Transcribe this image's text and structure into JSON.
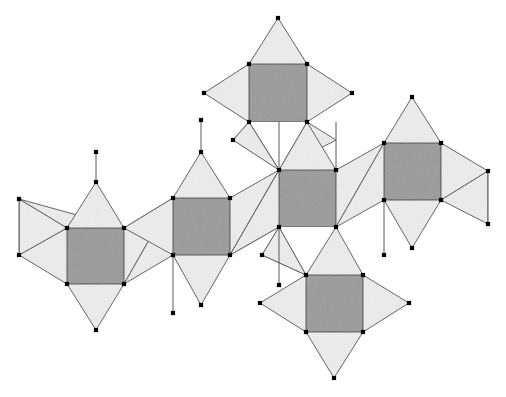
{
  "figure": {
    "canvas": {
      "width": 506,
      "height": 397
    },
    "colors": {
      "background": "#ffffff",
      "square_fill": "#9a9a9a",
      "triangle_fill": "#ededed",
      "square_stroke": "#444444",
      "triangle_stroke": "#5a5a5a",
      "edge_stroke": "#5a5a5a",
      "vertex_fill": "#000000"
    },
    "style": {
      "vertex_dot_size": 4.2,
      "square_stroke_width": 1.1,
      "triangle_stroke_width": 1.0,
      "edge_stroke_width": 1.0
    },
    "counts": {
      "squares": 6,
      "triangles": 22,
      "vertices": 46
    },
    "squares": [
      {
        "name": "square-top",
        "points": "249,64 307,64 307,122 249,122"
      },
      {
        "name": "square-left",
        "points": "67,228 124,228 124,284 67,284"
      },
      {
        "name": "square-mid-left",
        "points": "173,198 230,198 230,255 173,255"
      },
      {
        "name": "square-center",
        "points": "279,170 336,170 336,227 279,227"
      },
      {
        "name": "square-right",
        "points": "384,143 441,143 441,200 384,200"
      },
      {
        "name": "square-bottom",
        "points": "306,275 363,275 363,332 306,332"
      }
    ],
    "triangles": [
      {
        "name": "tri-top-up",
        "points": "249,64 307,64 278,18"
      },
      {
        "name": "tri-top-left",
        "points": "249,64 249,122 204,93"
      },
      {
        "name": "tri-top-right",
        "points": "307,64 307,122 352,93"
      },
      {
        "name": "tri-top-down-left",
        "points": "249,122 278,168 233,140"
      },
      {
        "name": "tri-top-down-right",
        "points": "307,122 279,170 336,140"
      },
      {
        "name": "tri-left-fan-upper",
        "points": "19,199 67,228 124,228"
      },
      {
        "name": "tri-left-fan-lower",
        "points": "19,255 67,228 67,284"
      },
      {
        "name": "tri-left-edge-up",
        "points": "19,199 19,255 67,228"
      },
      {
        "name": "tri-left-apex",
        "points": "67,228 124,228 96,182"
      },
      {
        "name": "tri-left-down",
        "points": "67,284 124,284 96,330"
      },
      {
        "name": "tri-left-right-up",
        "points": "124,228 173,198 124,284"
      },
      {
        "name": "tri-left-right-low",
        "points": "124,284 173,255 173,198"
      },
      {
        "name": "tri-ml-apex",
        "points": "173,198 230,198 201,152"
      },
      {
        "name": "tri-ml-left-up",
        "points": "124,228 173,198 173,255"
      },
      {
        "name": "tri-ml-down",
        "points": "173,255 230,255 201,305"
      },
      {
        "name": "tri-ml-right-up",
        "points": "230,198 279,170 230,255"
      },
      {
        "name": "tri-ml-right-low",
        "points": "230,255 279,227 279,170"
      },
      {
        "name": "tri-c-apex-left",
        "points": "279,170 233,140 249,122"
      },
      {
        "name": "tri-c-apex-right",
        "points": "279,170 336,170 307,122"
      },
      {
        "name": "tri-c-left-low",
        "points": "230,255 279,227 279,170"
      },
      {
        "name": "tri-c-right-up",
        "points": "336,170 384,143 336,227"
      },
      {
        "name": "tri-c-right-low",
        "points": "336,227 384,200 384,143"
      },
      {
        "name": "tri-c-down-left",
        "points": "279,227 306,275 262,255"
      },
      {
        "name": "tri-c-down-right",
        "points": "336,227 306,275 363,275"
      },
      {
        "name": "tri-r-apex",
        "points": "384,143 441,143 412,97"
      },
      {
        "name": "tri-r-down",
        "points": "384,200 441,200 412,248"
      },
      {
        "name": "tri-r-fan-upper",
        "points": "441,143 488,171 441,200"
      },
      {
        "name": "tri-r-fan-lower",
        "points": "488,171 488,224 441,200"
      },
      {
        "name": "tri-b-left",
        "points": "306,275 306,332 260,303"
      },
      {
        "name": "tri-b-right",
        "points": "363,275 363,332 409,303"
      },
      {
        "name": "tri-b-down",
        "points": "306,332 363,332 334,378"
      },
      {
        "name": "tri-b-up-left",
        "points": "306,275 279,227 262,255"
      }
    ],
    "edges": [
      {
        "name": "edge-left-vertical",
        "x1": 19,
        "y1": 199,
        "x2": 19,
        "y2": 255
      },
      {
        "name": "edge-ml-apex-vertical",
        "x1": 201,
        "y1": 152,
        "x2": 201,
        "y2": 120
      },
      {
        "name": "edge-ml-down-vertical",
        "x1": 173,
        "y1": 255,
        "x2": 173,
        "y2": 313
      },
      {
        "name": "edge-center-up-vertical",
        "x1": 279,
        "y1": 170,
        "x2": 279,
        "y2": 122
      },
      {
        "name": "edge-center-dn-vertical",
        "x1": 279,
        "y1": 227,
        "x2": 279,
        "y2": 285
      },
      {
        "name": "edge-right-up-vertical",
        "x1": 336,
        "y1": 170,
        "x2": 336,
        "y2": 122
      },
      {
        "name": "edge-right-dn-vertical",
        "x1": 384,
        "y1": 200,
        "x2": 384,
        "y2": 255
      },
      {
        "name": "edge-far-right-vertical",
        "x1": 488,
        "y1": 171,
        "x2": 488,
        "y2": 224
      },
      {
        "name": "edge-left-apex-vertical",
        "x1": 96,
        "y1": 182,
        "x2": 96,
        "y2": 152
      },
      {
        "name": "edge-left-down-vertical",
        "x1": 124,
        "y1": 284,
        "x2": 124,
        "y2": 284
      }
    ],
    "vertices": [
      {
        "name": "v-top-apex",
        "x": 278,
        "y": 18
      },
      {
        "name": "v-top-sq-tl",
        "x": 249,
        "y": 64
      },
      {
        "name": "v-top-sq-tr",
        "x": 307,
        "y": 64
      },
      {
        "name": "v-top-left-pt",
        "x": 204,
        "y": 93
      },
      {
        "name": "v-top-right-pt",
        "x": 352,
        "y": 93
      },
      {
        "name": "v-top-sq-bl",
        "x": 249,
        "y": 122
      },
      {
        "name": "v-top-sq-br",
        "x": 307,
        "y": 122
      },
      {
        "name": "v-top-dl",
        "x": 233,
        "y": 140
      },
      {
        "name": "v-r-apex",
        "x": 412,
        "y": 97
      },
      {
        "name": "v-ml-apex",
        "x": 201,
        "y": 152
      },
      {
        "name": "v-ml-apex-top",
        "x": 201,
        "y": 120
      },
      {
        "name": "v-r-sq-tl",
        "x": 384,
        "y": 143
      },
      {
        "name": "v-r-sq-tr",
        "x": 441,
        "y": 143
      },
      {
        "name": "v-c-sq-tl",
        "x": 279,
        "y": 170
      },
      {
        "name": "v-c-sq-tr",
        "x": 336,
        "y": 170
      },
      {
        "name": "v-far-right-top",
        "x": 488,
        "y": 171
      },
      {
        "name": "v-left-apex",
        "x": 96,
        "y": 182
      },
      {
        "name": "v-left-apex-top",
        "x": 96,
        "y": 152
      },
      {
        "name": "v-left-fan-top",
        "x": 19,
        "y": 199
      },
      {
        "name": "v-ml-sq-tl",
        "x": 173,
        "y": 198
      },
      {
        "name": "v-ml-sq-tr",
        "x": 230,
        "y": 198
      },
      {
        "name": "v-r-sq-bl",
        "x": 384,
        "y": 200
      },
      {
        "name": "v-r-sq-br",
        "x": 441,
        "y": 200
      },
      {
        "name": "v-far-right-bot",
        "x": 488,
        "y": 224
      },
      {
        "name": "v-c-sq-bl",
        "x": 279,
        "y": 227
      },
      {
        "name": "v-c-sq-br",
        "x": 336,
        "y": 227
      },
      {
        "name": "v-l-sq-tl",
        "x": 67,
        "y": 228
      },
      {
        "name": "v-l-sq-tr",
        "x": 124,
        "y": 228
      },
      {
        "name": "v-r-down-apex",
        "x": 412,
        "y": 248
      },
      {
        "name": "v-left-fan-bot",
        "x": 19,
        "y": 255
      },
      {
        "name": "v-ml-sq-bl",
        "x": 173,
        "y": 255
      },
      {
        "name": "v-ml-sq-br",
        "x": 230,
        "y": 255
      },
      {
        "name": "v-c-dl",
        "x": 262,
        "y": 255
      },
      {
        "name": "v-r-dn-end",
        "x": 384,
        "y": 255
      },
      {
        "name": "v-b-sq-tl",
        "x": 306,
        "y": 275
      },
      {
        "name": "v-b-sq-tr",
        "x": 363,
        "y": 275
      },
      {
        "name": "v-l-sq-bl",
        "x": 67,
        "y": 284
      },
      {
        "name": "v-l-sq-br",
        "x": 124,
        "y": 284
      },
      {
        "name": "v-c-dn-end",
        "x": 279,
        "y": 285
      },
      {
        "name": "v-b-left-pt",
        "x": 260,
        "y": 303
      },
      {
        "name": "v-b-right-pt",
        "x": 409,
        "y": 303
      },
      {
        "name": "v-ml-down-apex",
        "x": 201,
        "y": 305
      },
      {
        "name": "v-ml-dn-end",
        "x": 173,
        "y": 313
      },
      {
        "name": "v-l-down-apex",
        "x": 96,
        "y": 330
      },
      {
        "name": "v-b-sq-bl",
        "x": 306,
        "y": 332
      },
      {
        "name": "v-b-sq-br",
        "x": 363,
        "y": 332
      },
      {
        "name": "v-b-down-apex",
        "x": 334,
        "y": 378
      }
    ]
  }
}
